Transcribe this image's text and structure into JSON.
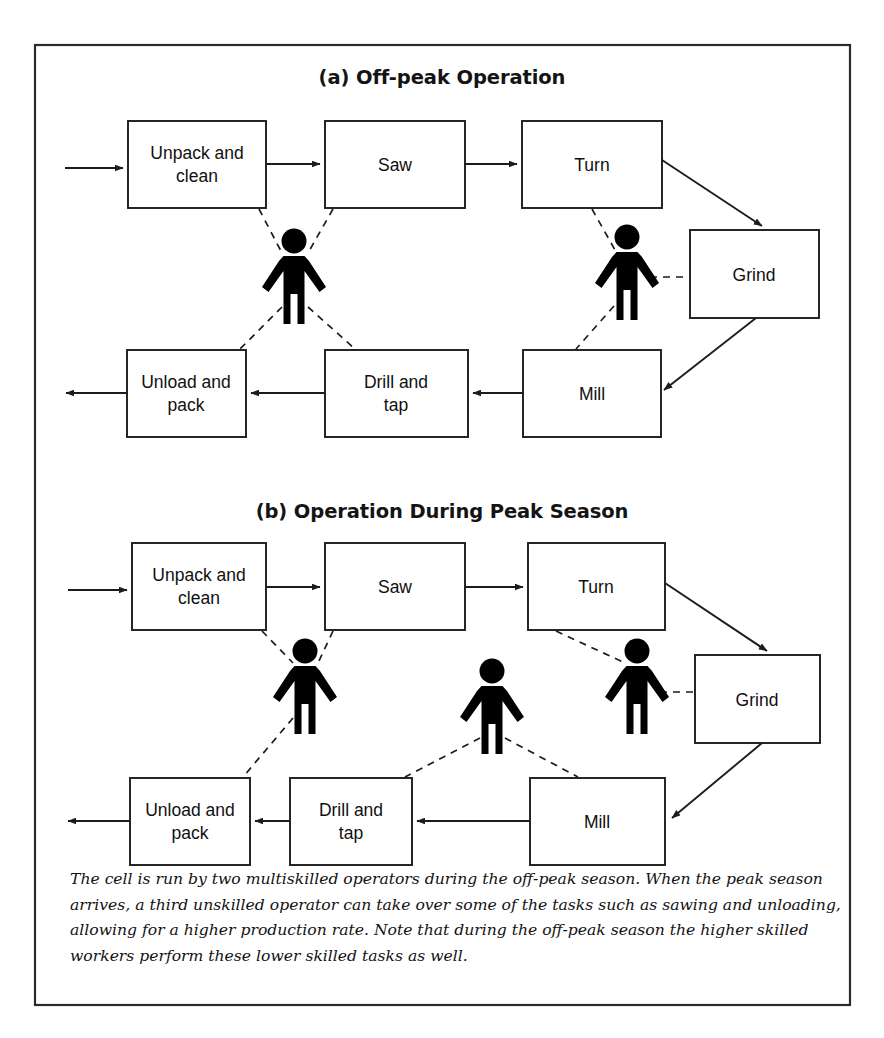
{
  "figure": {
    "frame": {
      "x": 35,
      "y": 45,
      "width": 815,
      "height": 960
    },
    "panels": [
      {
        "id": "panel-a",
        "title": "(a) Off-peak Operation",
        "title_x": 442,
        "title_y": 84,
        "boxes": [
          {
            "id": "a-unpack",
            "lines": [
              "Unpack and",
              "clean"
            ],
            "x": 128,
            "y": 121,
            "w": 138,
            "h": 87
          },
          {
            "id": "a-saw",
            "lines": [
              "Saw"
            ],
            "x": 325,
            "y": 121,
            "w": 140,
            "h": 87
          },
          {
            "id": "a-turn",
            "lines": [
              "Turn"
            ],
            "x": 522,
            "y": 121,
            "w": 140,
            "h": 87
          },
          {
            "id": "a-grind",
            "lines": [
              "Grind"
            ],
            "x": 690,
            "y": 230,
            "w": 129,
            "h": 88
          },
          {
            "id": "a-mill",
            "lines": [
              "Mill"
            ],
            "x": 523,
            "y": 350,
            "w": 138,
            "h": 87
          },
          {
            "id": "a-drill",
            "lines": [
              "Drill and",
              "tap"
            ],
            "x": 325,
            "y": 350,
            "w": 143,
            "h": 87
          },
          {
            "id": "a-unload",
            "lines": [
              "Unload and",
              "pack"
            ],
            "x": 127,
            "y": 350,
            "w": 119,
            "h": 87
          }
        ],
        "operators": [
          {
            "id": "a-op1",
            "cx": 294,
            "cy": 280,
            "scale": 1.0
          },
          {
            "id": "a-op2",
            "cx": 627,
            "cy": 276,
            "scale": 1.0
          }
        ],
        "flows": [
          {
            "id": "a-in",
            "from": "input",
            "to": "Unpack and clean"
          },
          {
            "id": "a-unpack-saw",
            "from": "Unpack and clean",
            "to": "Saw"
          },
          {
            "id": "a-saw-turn",
            "from": "Saw",
            "to": "Turn"
          },
          {
            "id": "a-turn-grind",
            "from": "Turn",
            "to": "Grind"
          },
          {
            "id": "a-grind-mill",
            "from": "Grind",
            "to": "Mill"
          },
          {
            "id": "a-mill-drill",
            "from": "Mill",
            "to": "Drill and tap"
          },
          {
            "id": "a-drill-unload",
            "from": "Drill and tap",
            "to": "Unload and pack"
          },
          {
            "id": "a-out",
            "from": "Unload and pack",
            "to": "output"
          }
        ],
        "assignments": [
          {
            "operator": "a-op1",
            "box": "Unpack and clean"
          },
          {
            "operator": "a-op1",
            "box": "Saw"
          },
          {
            "operator": "a-op1",
            "box": "Unload and pack"
          },
          {
            "operator": "a-op1",
            "box": "Drill and tap"
          },
          {
            "operator": "a-op2",
            "box": "Turn"
          },
          {
            "operator": "a-op2",
            "box": "Grind"
          },
          {
            "operator": "a-op2",
            "box": "Mill"
          }
        ]
      },
      {
        "id": "panel-b",
        "title": "(b) Operation During Peak Season",
        "title_x": 442,
        "title_y": 518,
        "boxes": [
          {
            "id": "b-unpack",
            "lines": [
              "Unpack and",
              "clean"
            ],
            "x": 132,
            "y": 543,
            "w": 134,
            "h": 87
          },
          {
            "id": "b-saw",
            "lines": [
              "Saw"
            ],
            "x": 325,
            "y": 543,
            "w": 140,
            "h": 87
          },
          {
            "id": "b-turn",
            "lines": [
              "Turn"
            ],
            "x": 528,
            "y": 543,
            "w": 137,
            "h": 87
          },
          {
            "id": "b-grind",
            "lines": [
              "Grind"
            ],
            "x": 695,
            "y": 655,
            "w": 125,
            "h": 88
          },
          {
            "id": "b-mill",
            "lines": [
              "Mill"
            ],
            "x": 530,
            "y": 778,
            "w": 135,
            "h": 87
          },
          {
            "id": "b-drill",
            "lines": [
              "Drill and",
              "tap"
            ],
            "x": 290,
            "y": 778,
            "w": 122,
            "h": 87
          },
          {
            "id": "b-unload",
            "lines": [
              "Unload and",
              "pack"
            ],
            "x": 130,
            "y": 778,
            "w": 120,
            "h": 87
          }
        ],
        "operators": [
          {
            "id": "b-op1",
            "cx": 305,
            "cy": 690,
            "scale": 1.0
          },
          {
            "id": "b-op2",
            "cx": 492,
            "cy": 710,
            "scale": 1.0
          },
          {
            "id": "b-op3",
            "cx": 637,
            "cy": 690,
            "scale": 1.0
          }
        ],
        "flows": [
          {
            "id": "b-in",
            "from": "input",
            "to": "Unpack and clean"
          },
          {
            "id": "b-unpack-saw",
            "from": "Unpack and clean",
            "to": "Saw"
          },
          {
            "id": "b-saw-turn",
            "from": "Saw",
            "to": "Turn"
          },
          {
            "id": "b-turn-grind",
            "from": "Turn",
            "to": "Grind"
          },
          {
            "id": "b-grind-mill",
            "from": "Grind",
            "to": "Mill"
          },
          {
            "id": "b-mill-drill",
            "from": "Mill",
            "to": "Drill and tap"
          },
          {
            "id": "b-drill-unload",
            "from": "Drill and tap",
            "to": "Unload and pack"
          },
          {
            "id": "b-out",
            "from": "Unload and pack",
            "to": "output"
          }
        ],
        "assignments": [
          {
            "operator": "b-op1",
            "box": "Unpack and clean"
          },
          {
            "operator": "b-op1",
            "box": "Saw"
          },
          {
            "operator": "b-op1",
            "box": "Unload and pack"
          },
          {
            "operator": "b-op2",
            "box": "Drill and tap"
          },
          {
            "operator": "b-op2",
            "box": "Mill"
          },
          {
            "operator": "b-op3",
            "box": "Turn"
          },
          {
            "operator": "b-op3",
            "box": "Grind"
          }
        ]
      }
    ],
    "caption": {
      "lines": [
        "The cell is run by two multiskilled operators during the off-peak season. When the peak season",
        "arrives, a third unskilled operator can take over some of the tasks such as sawing and unloading,",
        "allowing for a higher production rate. Note that during the off-peak season the higher skilled",
        "workers perform these lower skilled tasks as well."
      ],
      "x": 70,
      "y_start": 884,
      "line_height": 25.5
    },
    "colors": {
      "frame_stroke": "#2b2b2b",
      "box_stroke": "#1c1c1c",
      "box_fill": "#ffffff",
      "text": "#111111",
      "operator_fill": "#000000",
      "page_background": "#ffffff"
    },
    "icons": {
      "operator": "person-icon",
      "arrow": "arrow-icon"
    }
  }
}
